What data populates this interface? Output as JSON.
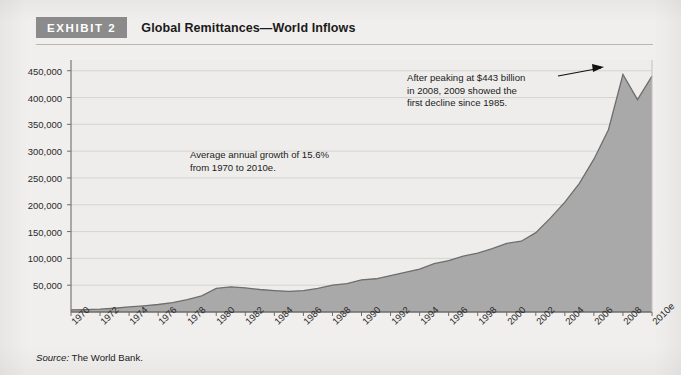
{
  "header": {
    "badge": "EXHIBIT 2",
    "title": "Global Remittances—World Inflows"
  },
  "annotations": {
    "growth": "Average annual growth of 15.6%\nfrom 1970 to 2010e.",
    "peak": "After peaking at $443 billion\nin 2008, 2009 showed the\nfirst decline since 1985."
  },
  "source": {
    "label": "Source:",
    "text": " The World Bank."
  },
  "colors": {
    "area_fill": "#a9a9a9",
    "area_line": "#6e6e6e",
    "grid": "#d3d1ce",
    "axis": "#6f6d6a",
    "badge_bg": "#8b8b8b",
    "page_bg": "#f0efed",
    "plot_bg": "#eeedeb",
    "text": "#1b1b1b"
  },
  "chart_data": {
    "type": "area",
    "title": "Global Remittances—World Inflows",
    "xlabel": "",
    "ylabel": "",
    "ylim": [
      0,
      470000
    ],
    "yticks": [
      50000,
      100000,
      150000,
      200000,
      250000,
      300000,
      350000,
      400000,
      450000
    ],
    "ytick_labels": [
      "50,000",
      "100,000",
      "150,000",
      "200,000",
      "250,000",
      "300,000",
      "350,000",
      "400,000",
      "450,000"
    ],
    "grid": true,
    "legend": "none",
    "xtick_labels": [
      "1970",
      "1972",
      "1974",
      "1976",
      "1978",
      "1980",
      "1982",
      "1984",
      "1986",
      "1988",
      "1990",
      "1992",
      "1994",
      "1996",
      "1998",
      "2000",
      "2002",
      "2004",
      "2006",
      "2008",
      "2010e"
    ],
    "x": [
      1970,
      1971,
      1972,
      1973,
      1974,
      1975,
      1976,
      1977,
      1978,
      1979,
      1980,
      1981,
      1982,
      1983,
      1984,
      1985,
      1986,
      1987,
      1988,
      1989,
      1990,
      1991,
      1992,
      1993,
      1994,
      1995,
      1996,
      1997,
      1998,
      1999,
      2000,
      2001,
      2002,
      2003,
      2004,
      2005,
      2006,
      2007,
      2008,
      2009,
      2010
    ],
    "values": [
      4000,
      4600,
      5400,
      7000,
      9500,
      11500,
      14000,
      17500,
      23000,
      30000,
      44000,
      47000,
      45000,
      42000,
      40000,
      38500,
      40000,
      44000,
      50000,
      53000,
      60000,
      62000,
      68000,
      74000,
      80000,
      90000,
      96000,
      104000,
      110000,
      118000,
      128000,
      132000,
      148000,
      175000,
      205000,
      240000,
      285000,
      340000,
      443000,
      396000,
      440000
    ],
    "annotations": [
      {
        "name": "growth-note",
        "text": "Average annual growth of 15.6% from 1970 to 2010e."
      },
      {
        "name": "peak-note",
        "text": "After peaking at $443 billion in 2008, 2009 showed the first decline since 1985.",
        "points_to": {
          "x": 2008,
          "y": 443000
        }
      }
    ]
  }
}
